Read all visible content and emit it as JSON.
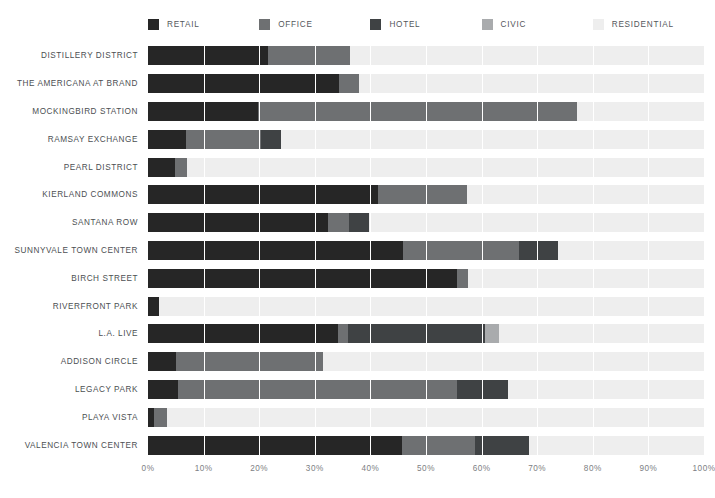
{
  "chart_data": {
    "type": "bar",
    "orientation": "horizontal",
    "stacked": true,
    "stack_mode": "percent",
    "title": "",
    "subtitle": "",
    "xlabel": "",
    "ylabel": "",
    "xlim": [
      0,
      100
    ],
    "xticks": [
      0,
      10,
      20,
      30,
      40,
      50,
      60,
      70,
      80,
      90,
      100
    ],
    "xtick_labels": [
      "0%",
      "10%",
      "20%",
      "30%",
      "40%",
      "50%",
      "60%",
      "70%",
      "80%",
      "90%",
      "100%"
    ],
    "grid": true,
    "grid_axis": "x",
    "legend_position": "top",
    "legend_entries": [
      "RETAIL",
      "OFFICE",
      "HOTEL",
      "CIVIC",
      "RESIDENTIAL"
    ],
    "colors": {
      "RETAIL": "#262626",
      "OFFICE": "#6e7072",
      "HOTEL": "#3f4244",
      "CIVIC": "#a9abad",
      "RESIDENTIAL": "#eeeeee"
    },
    "categories": [
      "DISTILLERY DISTRICT",
      "THE AMERICANA AT BRAND",
      "MOCKINGBIRD STATION",
      "RAMSAY EXCHANGE",
      "PEARL DISTRICT",
      "KIERLAND COMMONS",
      "SANTANA ROW",
      "SUNNYVALE TOWN CENTER",
      "BIRCH STREET",
      "RIVERFRONT PARK",
      "L.A. LIVE",
      "ADDISON CIRCLE",
      "LEGACY PARK",
      "PLAYA VISTA",
      "VALENCIA TOWN CENTER"
    ],
    "series": [
      {
        "name": "RETAIL",
        "color": "#262626",
        "values": [
          21.6,
          34.4,
          19.8,
          6.9,
          4.9,
          41.4,
          32.3,
          45.8,
          55.5,
          2.0,
          34.1,
          5.1,
          5.4,
          1.1,
          45.6
        ]
      },
      {
        "name": "OFFICE",
        "color": "#6e7072",
        "values": [
          14.8,
          3.5,
          57.3,
          13.5,
          2.2,
          15.9,
          3.9,
          21.0,
          2.1,
          0.0,
          1.9,
          26.4,
          50.1,
          2.3,
          13.3
        ]
      },
      {
        "name": "HOTEL",
        "color": "#3f4244",
        "values": [
          0.0,
          0.0,
          0.0,
          3.6,
          0.0,
          0.0,
          3.6,
          6.9,
          0.0,
          0.0,
          24.7,
          0.0,
          9.3,
          0.0,
          9.6
        ]
      },
      {
        "name": "CIVIC",
        "color": "#a9abad",
        "values": [
          0.0,
          0.0,
          0.0,
          0.0,
          0.0,
          0.0,
          0.0,
          0.0,
          0.0,
          0.0,
          2.4,
          0.0,
          0.0,
          0.0,
          0.0
        ]
      },
      {
        "name": "RESIDENTIAL",
        "color": "#eeeeee",
        "values": [
          63.6,
          62.1,
          22.9,
          76.0,
          92.9,
          42.7,
          60.2,
          26.3,
          42.4,
          98.0,
          36.9,
          68.5,
          35.2,
          96.6,
          31.5
        ]
      }
    ]
  }
}
